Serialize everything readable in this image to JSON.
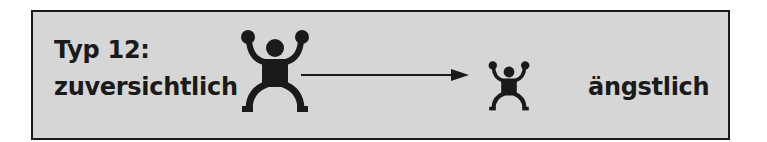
{
  "diagram": {
    "type_label": "Typ 12:",
    "from_label": "zuversichtlich",
    "to_label": "ängstlich",
    "figures": [
      {
        "name": "large-figure-icon",
        "meaning": "zuversichtlich",
        "size": "large"
      },
      {
        "name": "small-figure-icon",
        "meaning": "ängstlich",
        "size": "small"
      }
    ],
    "arrow": {
      "direction": "right"
    },
    "colors": {
      "background": "#d6d6d6",
      "border": "#1a1a1a",
      "ink": "#1a1a1a"
    }
  }
}
